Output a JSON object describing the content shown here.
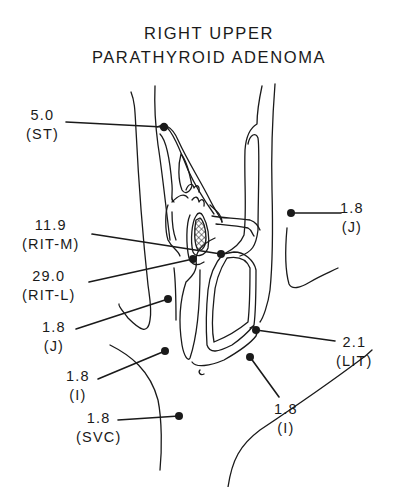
{
  "title": {
    "line1": "RIGHT UPPER",
    "line2": "PARATHYROID ADENOMA"
  },
  "colors": {
    "ink": "#1a1a1a",
    "background": "#ffffff"
  },
  "samples": [
    {
      "id": "st",
      "value": "5.0",
      "site": "(ST)"
    },
    {
      "id": "j-left-upper-right",
      "value": "1.8",
      "site": "(J)"
    },
    {
      "id": "rit-m",
      "value": "11.9",
      "site": "(RIT-M)"
    },
    {
      "id": "rit-l",
      "value": "29.0",
      "site": "(RIT-L)"
    },
    {
      "id": "j-left",
      "value": "1.8",
      "site": "(J)"
    },
    {
      "id": "lit",
      "value": "2.1",
      "site": "(LIT)"
    },
    {
      "id": "i-left",
      "value": "1.8",
      "site": "(I)"
    },
    {
      "id": "i-right",
      "value": "1.8",
      "site": "(I)"
    },
    {
      "id": "svc",
      "value": "1.8",
      "site": "(SVC)"
    }
  ]
}
